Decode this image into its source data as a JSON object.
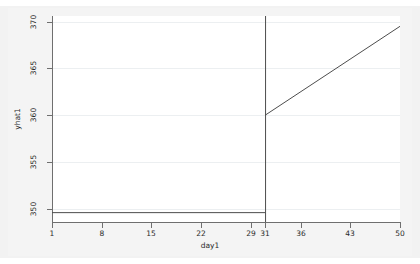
{
  "chart_data": {
    "type": "line",
    "title": "",
    "subtitle": "",
    "xlabel": "day1",
    "ylabel": "yhat1",
    "xlim": [
      1,
      50
    ],
    "ylim": [
      348.6,
      370.6
    ],
    "xticks": [
      1,
      8,
      15,
      22,
      29,
      31,
      36,
      43,
      50
    ],
    "xticklabels": [
      "1",
      "8",
      "15",
      "22",
      "29",
      "31",
      "36",
      "43",
      "50"
    ],
    "yticks": [
      350,
      355,
      360,
      365,
      370
    ],
    "yticklabels": [
      "350",
      "355",
      "360",
      "365",
      "370"
    ],
    "grid": "horizontal",
    "legend": "none",
    "series": [
      {
        "name": "yhat1 pre-intervention",
        "color": "#4d4d4d",
        "x": [
          1,
          31
        ],
        "values": [
          349.6,
          349.6
        ]
      },
      {
        "name": "yhat1 post-intervention",
        "color": "#4d4d4d",
        "x": [
          31,
          50
        ],
        "values": [
          360.0,
          369.5
        ]
      }
    ],
    "annotations": [
      {
        "type": "vertical-reference-line",
        "name": "intervention-line",
        "x": 31,
        "color": "#4d4d4d"
      }
    ]
  },
  "axes": {
    "y_title": "yhat1",
    "x_title": "day1"
  },
  "colors": {
    "figure_background": "#f2f2f2",
    "plot_background": "#ffffff",
    "axis": "#6f6f6f",
    "gridline": "#eceff1",
    "series": "#4d4d4d",
    "text": "#2a2a2a"
  }
}
